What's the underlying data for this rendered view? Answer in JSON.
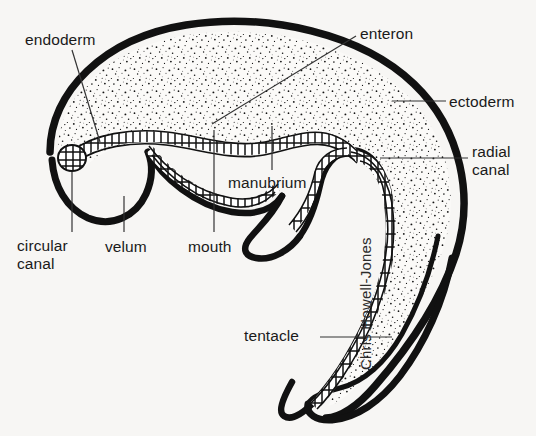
{
  "figure": {
    "background_color": "#f7f6f4",
    "ink_color": "#111111",
    "credit": "Chris Howell-Jones"
  },
  "labels": {
    "endoderm": "endoderm",
    "enteron": "enteron",
    "ectoderm": "ectoderm",
    "radial_canal_line1": "radial",
    "radial_canal_line2": "canal",
    "manubrium": "manubrium",
    "circular_canal_line1": "circular",
    "circular_canal_line2": "canal",
    "velum": "velum",
    "mouth": "mouth",
    "tentacle": "tentacle"
  },
  "structures": [
    {
      "name": "bell-outline",
      "description": "thick black umbrella-shaped bell wall"
    },
    {
      "name": "mesoglea",
      "description": "stippled jelly layer filling the bell"
    },
    {
      "name": "endoderm-lining",
      "description": "beaded cellular layer lining the gastric cavity and canals"
    },
    {
      "name": "circular-canal",
      "description": "bulbous cellular canal at the left bell margin"
    },
    {
      "name": "radial-canal",
      "description": "beaded canal running down the right side of the bell"
    },
    {
      "name": "manubrium",
      "description": "central stalk bearing the mouth"
    },
    {
      "name": "velum",
      "description": "inward shelf at the bell rim"
    },
    {
      "name": "tentacle",
      "description": "long curving tentacle trailing from the right bell margin"
    }
  ]
}
